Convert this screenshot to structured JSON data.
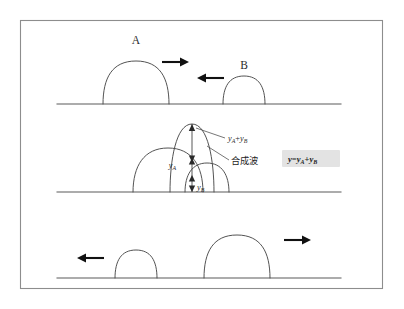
{
  "figure": {
    "type": "wave-superposition-diagram",
    "background_color": "#ffffff",
    "frame_color": "#8d8d8d",
    "stroke_color": "#4a4a4a",
    "panels": [
      {
        "id": "before",
        "baseline_y": 104,
        "description": "two pulses approaching",
        "pulses": [
          {
            "name": "A",
            "label": "A",
            "label_x": 136,
            "label_y": 44,
            "center_x": 136,
            "half_width": 33,
            "height": 44
          },
          {
            "name": "B",
            "label": "B",
            "label_x": 244,
            "label_y": 69,
            "center_x": 244,
            "half_width": 21,
            "height": 29
          }
        ],
        "arrows": [
          {
            "name": "arrow-a-right",
            "direction": "right",
            "x": 162,
            "y": 62,
            "length": 22
          },
          {
            "name": "arrow-b-left",
            "direction": "left",
            "x": 202,
            "y": 78,
            "length": 22
          }
        ]
      },
      {
        "id": "overlap",
        "baseline_y": 192,
        "description": "pulses overlapping, resultant wave is the sum",
        "pulses": [
          {
            "name": "A",
            "label": "y_A",
            "center_x": 168,
            "half_width": 35,
            "height": 44
          },
          {
            "name": "B",
            "label": "y_B",
            "center_x": 207,
            "half_width": 22,
            "height": 29
          },
          {
            "name": "resultant",
            "label": "y_A+y_B",
            "center_x": 192,
            "half_width": 22,
            "height": 68
          }
        ],
        "measurements": [
          {
            "name": "y-a-segment",
            "label_main": "y",
            "label_sub": "A",
            "x": 182,
            "y": 166
          },
          {
            "name": "y-b-segment",
            "label_main": "y",
            "label_sub": "B",
            "x": 196,
            "y": 188
          }
        ],
        "callouts": [
          {
            "name": "sum-label",
            "text_main": "y",
            "sub_1": "A",
            "op": "+",
            "text_2": "y",
            "sub_2": "B",
            "x": 228,
            "y": 140
          },
          {
            "name": "resultant-wave-label",
            "text": "合成波",
            "x": 232,
            "y": 163
          }
        ]
      },
      {
        "id": "after",
        "baseline_y": 278,
        "description": "pulses passed through each other and continue",
        "pulses": [
          {
            "name": "B",
            "center_x": 136,
            "half_width": 21,
            "height": 29
          },
          {
            "name": "A",
            "center_x": 237,
            "half_width": 33,
            "height": 44
          }
        ],
        "arrows": [
          {
            "name": "arrow-b-left",
            "direction": "left",
            "x": 86,
            "y": 258,
            "length": 22
          },
          {
            "name": "arrow-a-right",
            "direction": "right",
            "x": 284,
            "y": 240,
            "length": 22
          }
        ]
      }
    ],
    "formula_box": {
      "name": "superposition-formula",
      "background_color": "#e3e3e3",
      "text_y": "y",
      "equals": "=",
      "text_ya": "y",
      "sub_a": "A",
      "plus": "+",
      "text_yb": "y",
      "sub_b": "B",
      "full_text": "y=yA+yB",
      "x": 282,
      "y": 150,
      "width": 58,
      "height": 17
    }
  }
}
